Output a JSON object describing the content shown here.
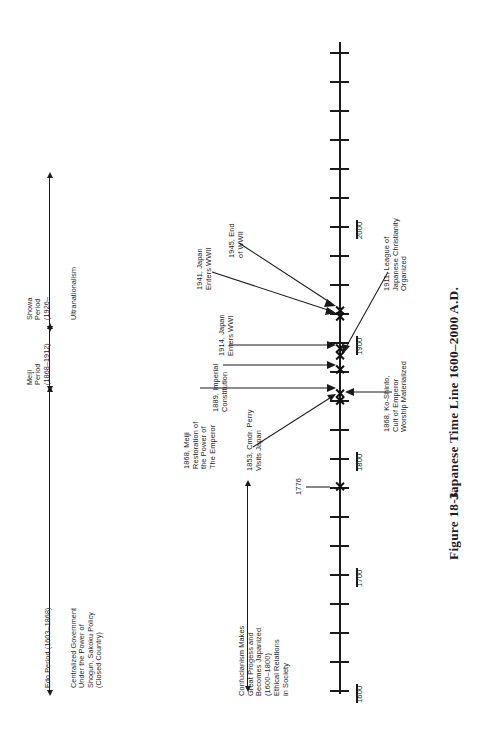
{
  "figure": {
    "caption_number": "Figure 18-3.",
    "caption_title": "Japanese Time Line 1600–2000 A.D."
  },
  "axis": {
    "orientation": "vertical-rotated",
    "range_start": 1600,
    "range_end": 2025,
    "minor_tick_interval": 25,
    "major_tick_interval": 100,
    "tick_labels": [
      "1600",
      "1700",
      "1800",
      "1900",
      "2000"
    ]
  },
  "periods": [
    {
      "id": "edo",
      "label": "Edo Period (1603–1868)",
      "description": "Centralized Government\nUnder the Power of\nShogun, Sakoku Policy\n(Closed Country)",
      "italic_part": "Sakoku Policy"
    },
    {
      "id": "meiji",
      "label": "Meiji\nPeriod\n(1868–1912)"
    },
    {
      "id": "showa",
      "label": "Showa\nPeriod\n(1926–",
      "description": "Ultranationalism"
    }
  ],
  "trend": {
    "label": "Confucianism Makes\nGreat Progess and\nBecomes Japanized\n(1600–1800)\nEthical Relations\nin Society"
  },
  "events": [
    {
      "id": "e1776",
      "year": 1776,
      "label": "1776"
    },
    {
      "id": "e1853",
      "year": 1853,
      "label": "1853, Cmdr. Perry\nVisits Japan"
    },
    {
      "id": "e1868a",
      "year": 1868,
      "label": "1868, Meiji\nRestoration of\nthe Power of\nThe Emperor"
    },
    {
      "id": "e1868b",
      "year": 1868,
      "label": "1868, Ko-Shinto,\nCult of Emperor\nWorship Materialized"
    },
    {
      "id": "e1889",
      "year": 1889,
      "label": "1889, Imperial\nConstitution"
    },
    {
      "id": "e1911",
      "year": 1911,
      "label": "1911, League of\nJapanese Christianity\nOrganized"
    },
    {
      "id": "e1914",
      "year": 1914,
      "label": "1914, Japan\nEnters WWI"
    },
    {
      "id": "e1941",
      "year": 1941,
      "label": "1941, Japan\nEnters WWII"
    },
    {
      "id": "e1945",
      "year": 1945,
      "label": "1945, End\nof WWII"
    }
  ],
  "colors": {
    "ink": "#1a1a1a",
    "paper": "#ffffff"
  }
}
